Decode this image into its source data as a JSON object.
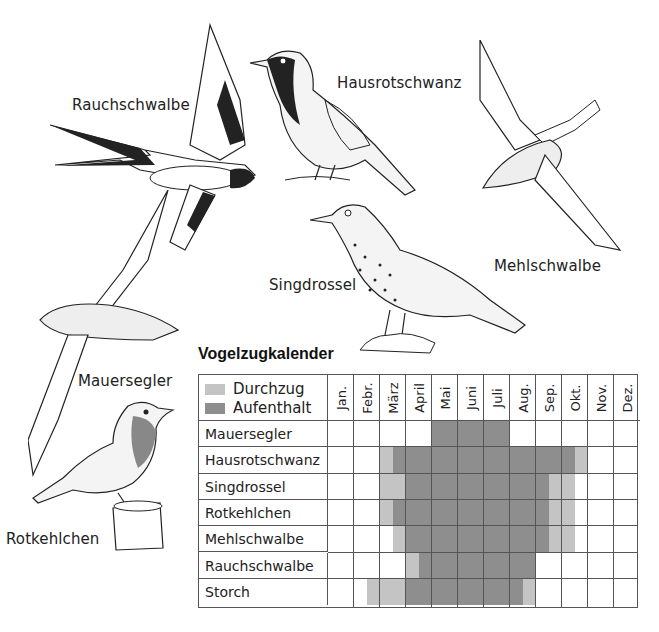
{
  "birds": [
    {
      "name": "Rauchschwalbe",
      "label_x": 72,
      "label_y": 96
    },
    {
      "name": "Hausrotschwanz",
      "label_x": 337,
      "label_y": 74
    },
    {
      "name": "Mehlschwalbe",
      "label_x": 494,
      "label_y": 257
    },
    {
      "name": "Singdrossel",
      "label_x": 269,
      "label_y": 276
    },
    {
      "name": "Mauersegler",
      "label_x": 78,
      "label_y": 372
    },
    {
      "name": "Rotkehlchen",
      "label_x": 6,
      "label_y": 530
    }
  ],
  "calendar": {
    "title": "Vogelzugkalender",
    "legend": [
      {
        "label": "Durchzug",
        "color": "#c4c4c4"
      },
      {
        "label": "Aufenthalt",
        "color": "#8e8e8e"
      }
    ],
    "months": [
      "Jan.",
      "Febr.",
      "März",
      "April",
      "Mai",
      "Juni",
      "Juli",
      "Aug.",
      "Sep.",
      "Okt.",
      "Nov.",
      "Dez."
    ],
    "rows": [
      {
        "bird": "Mauersegler",
        "segments": [
          {
            "type": "Aufenthalt",
            "start": 4.0,
            "end": 7.0
          }
        ]
      },
      {
        "bird": "Hausrotschwanz",
        "segments": [
          {
            "type": "Durchzug",
            "start": 2.0,
            "end": 2.5
          },
          {
            "type": "Aufenthalt",
            "start": 2.5,
            "end": 9.5
          },
          {
            "type": "Durchzug",
            "start": 9.5,
            "end": 10.0
          }
        ]
      },
      {
        "bird": "Singdrossel",
        "segments": [
          {
            "type": "Durchzug",
            "start": 2.0,
            "end": 3.0
          },
          {
            "type": "Aufenthalt",
            "start": 3.0,
            "end": 8.5
          },
          {
            "type": "Durchzug",
            "start": 8.5,
            "end": 9.5
          }
        ]
      },
      {
        "bird": "Rotkehlchen",
        "segments": [
          {
            "type": "Durchzug",
            "start": 2.0,
            "end": 2.5
          },
          {
            "type": "Aufenthalt",
            "start": 2.5,
            "end": 8.5
          },
          {
            "type": "Durchzug",
            "start": 8.5,
            "end": 9.5
          }
        ]
      },
      {
        "bird": "Mehlschwalbe",
        "segments": [
          {
            "type": "Durchzug",
            "start": 2.5,
            "end": 3.0
          },
          {
            "type": "Aufenthalt",
            "start": 3.0,
            "end": 8.5
          },
          {
            "type": "Durchzug",
            "start": 8.5,
            "end": 9.5
          }
        ]
      },
      {
        "bird": "Rauchschwalbe",
        "segments": [
          {
            "type": "Durchzug",
            "start": 3.0,
            "end": 3.5
          },
          {
            "type": "Aufenthalt",
            "start": 3.5,
            "end": 8.0
          }
        ]
      },
      {
        "bird": "Storch",
        "segments": [
          {
            "type": "Durchzug",
            "start": 1.5,
            "end": 3.0
          },
          {
            "type": "Aufenthalt",
            "start": 3.0,
            "end": 7.5
          },
          {
            "type": "Durchzug",
            "start": 7.5,
            "end": 8.0
          }
        ]
      }
    ]
  }
}
